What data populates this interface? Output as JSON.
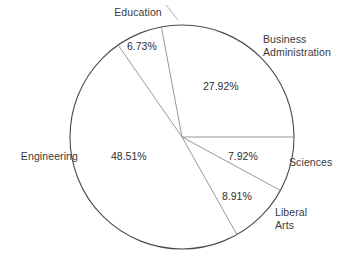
{
  "chart_data": {
    "type": "pie",
    "title": "",
    "categories": [
      "Business Administration",
      "Sciences",
      "Liberal Arts",
      "Engineering",
      "Education"
    ],
    "values": [
      27.92,
      7.92,
      8.91,
      48.51,
      6.73
    ],
    "value_labels": [
      "27.92%",
      "7.92%",
      "8.91%",
      "48.51%",
      "6.73%"
    ],
    "units": "percent",
    "legend": "none",
    "grid": false,
    "start_angle_deg": 0,
    "direction": "clockwise",
    "slices": [
      {
        "name": "Business Administration",
        "label": "Business\nAdministration",
        "value": 27.92,
        "value_label": "27.92%",
        "start_deg": 259.4,
        "end_deg": 360.0,
        "label_pos": "outside-top-right",
        "value_pos": "inside"
      },
      {
        "name": "Sciences",
        "label": "Sciences",
        "value": 7.92,
        "value_label": "7.92%",
        "start_deg": 0.0,
        "end_deg": 28.5,
        "label_pos": "outside-right",
        "value_pos": "inside"
      },
      {
        "name": "Liberal Arts",
        "label": "Liberal\nArts",
        "value": 8.91,
        "value_label": "8.91%",
        "start_deg": 28.5,
        "end_deg": 60.6,
        "label_pos": "outside-bottom-right",
        "value_pos": "inside"
      },
      {
        "name": "Engineering",
        "label": "Engineering",
        "value": 48.51,
        "value_label": "48.51%",
        "start_deg": 60.6,
        "end_deg": 235.2,
        "label_pos": "outside-left",
        "value_pos": "inside"
      },
      {
        "name": "Education",
        "label": "Education",
        "value": 6.73,
        "value_label": "6.73%",
        "start_deg": 235.2,
        "end_deg": 259.4,
        "label_pos": "outside-top",
        "value_pos": "inside"
      }
    ],
    "colors": {
      "background": "#ffffff",
      "outline": "#4a4a4a",
      "spoke": "#8c8c8c",
      "leader": "#9a9a9a",
      "text": "#3a3a3a",
      "slice_fill": "#ffffff"
    },
    "geometry": {
      "center_x": 182,
      "center_y": 137,
      "radius": 112
    }
  }
}
